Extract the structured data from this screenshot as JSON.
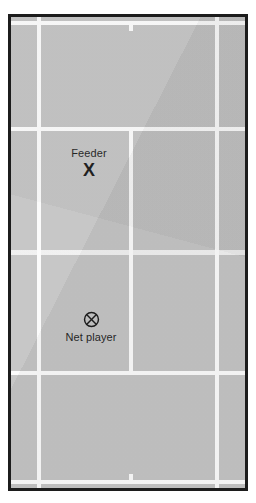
{
  "diagram": {
    "surface_color": "#c2c2c2",
    "line_color": "#fbfbfb",
    "frame_color": "#1c1c1c",
    "orientation": "portrait"
  },
  "court": {
    "lines": [
      {
        "name": "baseline-top",
        "type": "horizontal"
      },
      {
        "name": "baseline-bottom",
        "type": "horizontal"
      },
      {
        "name": "service-line-top",
        "type": "horizontal"
      },
      {
        "name": "service-line-bottom",
        "type": "horizontal"
      },
      {
        "name": "net-line",
        "type": "horizontal"
      },
      {
        "name": "singles-sideline-left",
        "type": "vertical"
      },
      {
        "name": "singles-sideline-right",
        "type": "vertical"
      },
      {
        "name": "center-service-line",
        "type": "vertical"
      }
    ],
    "center_marks": [
      "top",
      "bottom"
    ]
  },
  "markers": [
    {
      "id": "feeder",
      "label": "Feeder",
      "symbol": "X",
      "symbol_name": "x-marker",
      "label_position": "above"
    },
    {
      "id": "net-player",
      "label": "Net player",
      "symbol": "⊗",
      "symbol_name": "circled-x-marker",
      "label_position": "below"
    }
  ]
}
